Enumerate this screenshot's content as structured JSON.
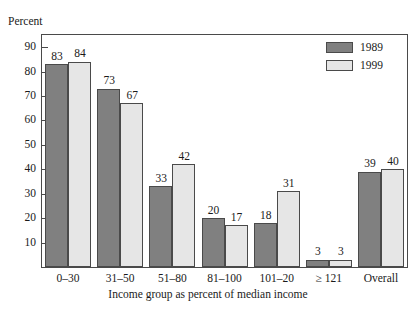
{
  "top_cut_text": "",
  "axis": {
    "y_caption": "Percent",
    "x_caption": "Income group as percent of median income",
    "y_ticks": [
      10,
      20,
      30,
      40,
      50,
      60,
      70,
      80,
      90
    ]
  },
  "legend": {
    "items": [
      {
        "label": "1989",
        "color": "#808080"
      },
      {
        "label": "1999",
        "color": "#e6e6e6"
      }
    ]
  },
  "colors": {
    "series_1989": "#808080",
    "series_1999": "#e6e6e6",
    "outline": "#4a4a4a",
    "text": "#1a1a1a",
    "background": "#ffffff"
  },
  "chart_data": {
    "type": "bar",
    "title": "",
    "xlabel": "Income group as percent of median income",
    "ylabel": "Percent",
    "ylim": [
      0,
      95
    ],
    "grid": false,
    "legend_position": "top-right",
    "categories": [
      "0–30",
      "31–50",
      "51–80",
      "81–100",
      "101–20",
      "≥ 121",
      "Overall"
    ],
    "series": [
      {
        "name": "1989",
        "values": [
          83,
          73,
          33,
          20,
          18,
          3,
          39
        ]
      },
      {
        "name": "1999",
        "values": [
          84,
          67,
          42,
          17,
          31,
          3,
          40
        ]
      }
    ]
  }
}
